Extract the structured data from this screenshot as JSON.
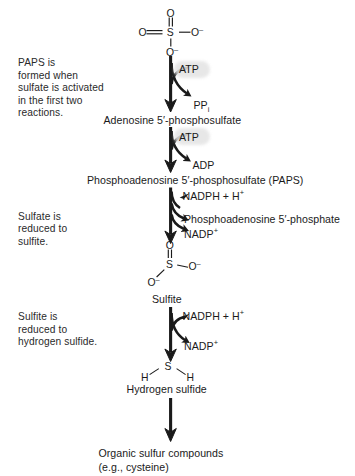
{
  "diagram": {
    "background_color": "#ffffff",
    "ink_color": "#1a1a1a",
    "highlight_color": "#e3e3e3"
  },
  "annotations": [
    {
      "id": "note-paps",
      "text": "PAPS is\nformed when\nsulfate is activated\nin the first two\nreactions."
    },
    {
      "id": "note-sulfate",
      "text": "Sulfate is\nreduced to\nsulfite."
    },
    {
      "id": "note-sulfite",
      "text": "Sulfite is\nreduced to\nhydrogen sulfide."
    }
  ],
  "structures": {
    "sulfate": {
      "name": "sulfate",
      "top_o": "O",
      "left_o": "O",
      "center_s": "S",
      "right_o": "O",
      "right_charge": "–",
      "bottom_o": "O",
      "bottom_charge": "–",
      "double_bond_left": "=",
      "double_bond_top": "‖"
    },
    "sulfite": {
      "name": "sulfite",
      "top_o": "O",
      "center_s": "S",
      "right_o": "O",
      "right_charge": "–",
      "lower_left_o": "O",
      "lower_left_charge": "–"
    },
    "hydrogen_sulfide": {
      "name": "hydrogen sulfide",
      "left_h": "H",
      "center_s": "S",
      "right_h": "H"
    }
  },
  "compounds": [
    {
      "id": "aps",
      "label": "Adenosine 5′-phosphosulfate"
    },
    {
      "id": "paps",
      "label": "Phosphoadenosine 5′-phosphosulfate (PAPS)"
    },
    {
      "id": "sulfite",
      "label": "Sulfite"
    },
    {
      "id": "h2s",
      "label": "Hydrogen sulfide"
    }
  ],
  "products": {
    "line1": "Organic sulfur compounds",
    "line2": "(e.g., cysteine)"
  },
  "cofactors": {
    "atp_1": "ATP",
    "ppi_label": "PP",
    "ppi_sub": "i",
    "atp_2": "ATP",
    "adp": "ADP",
    "nadph_1": "NADPH + H",
    "nadph_1_sup": "+",
    "pap": "Phosphoadenosine 5′-phosphate",
    "nadp_1": "NADP",
    "nadp_1_sup": "+",
    "nadph_2": "NADPH + H",
    "nadph_2_sup": "+",
    "nadp_2": "NADP",
    "nadp_2_sup": "+"
  }
}
